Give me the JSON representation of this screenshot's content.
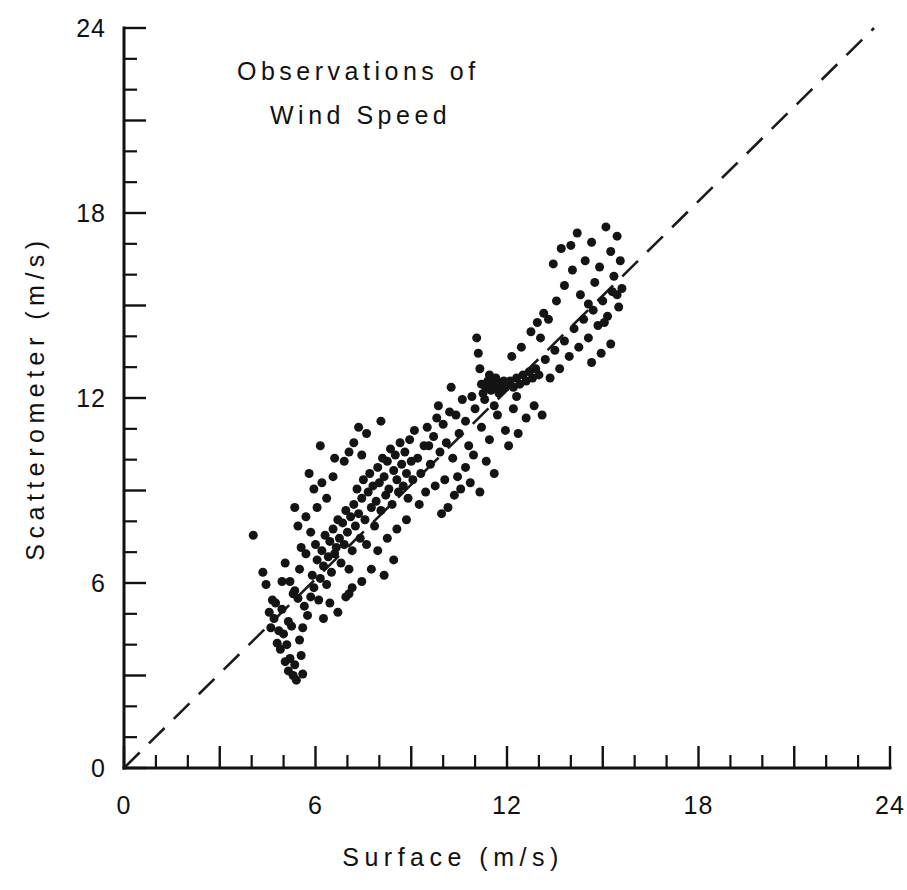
{
  "chart_data": {
    "type": "scatter",
    "title": "Observations of Wind Speed",
    "title_lines": [
      "Observations of",
      "Wind Speed"
    ],
    "xlabel": "Surface  (m/s)",
    "ylabel": "Scatterometer  (m/s)",
    "xlim": [
      0,
      24
    ],
    "ylim": [
      0,
      24
    ],
    "xticks_labeled": [
      0,
      6,
      12,
      18,
      24
    ],
    "yticks_labeled": [
      0,
      6,
      12,
      18,
      24
    ],
    "xtick_labels": [
      "0",
      "6",
      "12",
      "18",
      "24"
    ],
    "ytick_labels": [
      "0",
      "6",
      "12",
      "18",
      "24"
    ],
    "minor_tick_interval": 1,
    "major_tick_interval": 3,
    "grid": false,
    "legend": false,
    "marker": "filled-circle",
    "marker_color": "#141414",
    "marker_size_px": 9,
    "reference_line": {
      "label": "1:1 line",
      "style": "dashed",
      "color": "#1b1b1b",
      "x0": 0,
      "y0": 0,
      "x1": 23.5,
      "y1": 24
    },
    "n_points": 248,
    "points": [
      [
        4.05,
        7.55
      ],
      [
        4.35,
        6.35
      ],
      [
        4.45,
        5.95
      ],
      [
        4.55,
        5.05
      ],
      [
        4.6,
        4.55
      ],
      [
        4.7,
        4.85
      ],
      [
        4.75,
        5.35
      ],
      [
        4.8,
        4.05
      ],
      [
        4.85,
        4.45
      ],
      [
        4.9,
        3.85
      ],
      [
        4.95,
        5.15
      ],
      [
        5.0,
        4.35
      ],
      [
        5.05,
        3.45
      ],
      [
        5.1,
        4.0
      ],
      [
        5.15,
        3.15
      ],
      [
        5.2,
        3.55
      ],
      [
        5.25,
        4.6
      ],
      [
        5.3,
        3.0
      ],
      [
        5.35,
        3.35
      ],
      [
        5.4,
        2.85
      ],
      [
        5.45,
        5.5
      ],
      [
        5.5,
        4.15
      ],
      [
        5.55,
        3.65
      ],
      [
        5.6,
        3.05
      ],
      [
        5.05,
        6.65
      ],
      [
        5.2,
        6.05
      ],
      [
        5.35,
        5.75
      ],
      [
        5.5,
        6.45
      ],
      [
        5.65,
        5.25
      ],
      [
        5.7,
        6.95
      ],
      [
        5.75,
        4.95
      ],
      [
        5.85,
        5.55
      ],
      [
        5.9,
        6.25
      ],
      [
        5.95,
        5.85
      ],
      [
        6.0,
        7.25
      ],
      [
        6.05,
        6.75
      ],
      [
        6.1,
        5.45
      ],
      [
        6.15,
        6.15
      ],
      [
        6.2,
        7.05
      ],
      [
        6.25,
        6.55
      ],
      [
        6.3,
        7.55
      ],
      [
        6.35,
        5.95
      ],
      [
        6.4,
        6.85
      ],
      [
        6.45,
        7.35
      ],
      [
        6.5,
        6.35
      ],
      [
        6.55,
        7.75
      ],
      [
        6.6,
        6.95
      ],
      [
        6.65,
        7.15
      ],
      [
        6.7,
        8.05
      ],
      [
        6.75,
        7.45
      ],
      [
        6.8,
        6.65
      ],
      [
        6.85,
        7.95
      ],
      [
        6.9,
        7.25
      ],
      [
        6.95,
        8.35
      ],
      [
        7.0,
        7.65
      ],
      [
        7.05,
        6.45
      ],
      [
        7.1,
        8.15
      ],
      [
        7.15,
        7.05
      ],
      [
        7.2,
        8.55
      ],
      [
        7.25,
        7.85
      ],
      [
        7.3,
        9.05
      ],
      [
        7.35,
        8.25
      ],
      [
        7.4,
        7.45
      ],
      [
        7.45,
        8.75
      ],
      [
        7.5,
        9.35
      ],
      [
        7.55,
        8.05
      ],
      [
        7.6,
        7.25
      ],
      [
        7.65,
        8.95
      ],
      [
        7.7,
        9.55
      ],
      [
        7.75,
        8.45
      ],
      [
        7.8,
        9.15
      ],
      [
        7.85,
        7.85
      ],
      [
        7.9,
        8.65
      ],
      [
        7.95,
        9.75
      ],
      [
        8.0,
        9.25
      ],
      [
        8.05,
        8.35
      ],
      [
        8.1,
        10.05
      ],
      [
        8.15,
        9.45
      ],
      [
        8.2,
        8.85
      ],
      [
        8.25,
        9.95
      ],
      [
        8.3,
        9.05
      ],
      [
        8.35,
        10.35
      ],
      [
        8.4,
        8.55
      ],
      [
        8.45,
        9.65
      ],
      [
        8.5,
        10.15
      ],
      [
        8.55,
        9.35
      ],
      [
        8.6,
        8.95
      ],
      [
        8.65,
        10.55
      ],
      [
        8.7,
        9.85
      ],
      [
        8.75,
        9.15
      ],
      [
        8.8,
        10.25
      ],
      [
        8.85,
        9.55
      ],
      [
        8.9,
        8.75
      ],
      [
        8.95,
        10.65
      ],
      [
        9.0,
        9.95
      ],
      [
        9.05,
        9.35
      ],
      [
        6.9,
        9.95
      ],
      [
        7.05,
        10.25
      ],
      [
        7.2,
        10.55
      ],
      [
        7.45,
        10.15
      ],
      [
        7.6,
        10.85
      ],
      [
        6.55,
        9.45
      ],
      [
        6.35,
        8.75
      ],
      [
        6.2,
        9.25
      ],
      [
        6.05,
        8.45
      ],
      [
        5.95,
        9.05
      ],
      [
        6.45,
        5.35
      ],
      [
        6.7,
        5.05
      ],
      [
        6.95,
        5.55
      ],
      [
        7.15,
        5.85
      ],
      [
        6.25,
        4.85
      ],
      [
        5.85,
        7.65
      ],
      [
        5.7,
        8.15
      ],
      [
        5.55,
        7.15
      ],
      [
        5.45,
        7.85
      ],
      [
        5.35,
        8.45
      ],
      [
        9.1,
        10.95
      ],
      [
        9.2,
        10.05
      ],
      [
        9.3,
        9.55
      ],
      [
        9.4,
        10.45
      ],
      [
        9.5,
        11.05
      ],
      [
        9.6,
        9.85
      ],
      [
        9.7,
        10.75
      ],
      [
        9.8,
        11.35
      ],
      [
        9.9,
        10.25
      ],
      [
        10.0,
        11.15
      ],
      [
        10.1,
        10.55
      ],
      [
        10.2,
        11.55
      ],
      [
        10.3,
        10.05
      ],
      [
        10.4,
        11.45
      ],
      [
        10.5,
        10.85
      ],
      [
        10.6,
        11.95
      ],
      [
        10.7,
        11.25
      ],
      [
        10.8,
        10.45
      ],
      [
        10.9,
        12.05
      ],
      [
        11.0,
        11.65
      ],
      [
        11.05,
        13.95
      ],
      [
        11.1,
        13.45
      ],
      [
        11.15,
        12.95
      ],
      [
        11.2,
        12.45
      ],
      [
        11.25,
        12.15
      ],
      [
        11.3,
        11.95
      ],
      [
        11.35,
        12.35
      ],
      [
        11.4,
        12.55
      ],
      [
        11.45,
        12.75
      ],
      [
        11.5,
        12.25
      ],
      [
        11.55,
        12.45
      ],
      [
        11.6,
        11.75
      ],
      [
        11.65,
        12.65
      ],
      [
        11.7,
        12.35
      ],
      [
        11.75,
        12.15
      ],
      [
        11.8,
        12.45
      ],
      [
        11.85,
        12.25
      ],
      [
        11.9,
        12.55
      ],
      [
        11.95,
        12.35
      ],
      [
        12.0,
        12.45
      ],
      [
        12.1,
        12.55
      ],
      [
        12.2,
        12.35
      ],
      [
        12.3,
        12.65
      ],
      [
        12.4,
        12.45
      ],
      [
        12.5,
        12.75
      ],
      [
        12.6,
        12.55
      ],
      [
        12.7,
        12.85
      ],
      [
        12.8,
        12.65
      ],
      [
        12.9,
        12.95
      ],
      [
        13.0,
        12.75
      ],
      [
        11.2,
        11.05
      ],
      [
        11.45,
        10.65
      ],
      [
        11.7,
        11.45
      ],
      [
        11.95,
        10.95
      ],
      [
        12.2,
        11.65
      ],
      [
        10.95,
        10.15
      ],
      [
        10.7,
        9.75
      ],
      [
        10.45,
        9.45
      ],
      [
        11.35,
        9.95
      ],
      [
        11.6,
        9.55
      ],
      [
        12.05,
        10.45
      ],
      [
        12.35,
        10.85
      ],
      [
        12.6,
        11.35
      ],
      [
        12.85,
        11.75
      ],
      [
        13.1,
        11.45
      ],
      [
        13.2,
        13.25
      ],
      [
        13.35,
        12.65
      ],
      [
        13.5,
        13.55
      ],
      [
        13.65,
        12.95
      ],
      [
        13.8,
        13.85
      ],
      [
        13.95,
        13.35
      ],
      [
        14.1,
        14.25
      ],
      [
        14.25,
        13.65
      ],
      [
        14.4,
        14.55
      ],
      [
        14.55,
        13.95
      ],
      [
        14.7,
        14.85
      ],
      [
        14.85,
        14.35
      ],
      [
        15.0,
        15.15
      ],
      [
        15.15,
        14.65
      ],
      [
        15.3,
        15.45
      ],
      [
        13.3,
        14.55
      ],
      [
        13.55,
        15.15
      ],
      [
        13.8,
        15.65
      ],
      [
        14.05,
        16.15
      ],
      [
        14.3,
        15.35
      ],
      [
        14.0,
        16.95
      ],
      [
        14.2,
        17.35
      ],
      [
        14.45,
        16.45
      ],
      [
        14.65,
        17.05
      ],
      [
        14.9,
        16.25
      ],
      [
        15.1,
        17.55
      ],
      [
        15.25,
        16.75
      ],
      [
        15.35,
        15.95
      ],
      [
        15.45,
        17.25
      ],
      [
        14.75,
        15.75
      ],
      [
        13.45,
        16.35
      ],
      [
        13.7,
        16.85
      ],
      [
        14.55,
        15.05
      ],
      [
        15.05,
        14.45
      ],
      [
        15.5,
        14.95
      ],
      [
        12.75,
        14.15
      ],
      [
        13.05,
        13.95
      ],
      [
        12.45,
        13.65
      ],
      [
        12.15,
        13.35
      ],
      [
        12.95,
        14.45
      ],
      [
        15.55,
        16.45
      ],
      [
        15.6,
        15.55
      ],
      [
        15.25,
        13.75
      ],
      [
        14.95,
        13.45
      ],
      [
        14.65,
        13.15
      ],
      [
        9.45,
        8.95
      ],
      [
        9.75,
        9.15
      ],
      [
        10.05,
        9.35
      ],
      [
        10.35,
        8.85
      ],
      [
        9.25,
        8.55
      ],
      [
        8.85,
        8.05
      ],
      [
        8.55,
        7.75
      ],
      [
        8.25,
        7.45
      ],
      [
        7.95,
        7.05
      ],
      [
        9.55,
        10.45
      ],
      [
        10.15,
        8.45
      ],
      [
        10.55,
        9.05
      ],
      [
        10.85,
        9.25
      ],
      [
        11.15,
        8.95
      ],
      [
        9.95,
        8.25
      ],
      [
        7.75,
        6.45
      ],
      [
        7.45,
        6.05
      ],
      [
        7.05,
        5.65
      ],
      [
        8.15,
        6.25
      ],
      [
        8.45,
        6.75
      ],
      [
        4.95,
        6.05
      ],
      [
        5.15,
        4.75
      ],
      [
        5.3,
        5.65
      ],
      [
        4.65,
        5.45
      ],
      [
        5.6,
        4.55
      ],
      [
        6.15,
        10.45
      ],
      [
        6.6,
        10.05
      ],
      [
        5.8,
        9.55
      ],
      [
        7.35,
        11.05
      ],
      [
        8.05,
        11.25
      ],
      [
        9.85,
        11.75
      ],
      [
        10.25,
        12.35
      ],
      [
        12.3,
        12.05
      ],
      [
        13.15,
        14.75
      ],
      [
        15.45,
        15.35
      ]
    ]
  }
}
